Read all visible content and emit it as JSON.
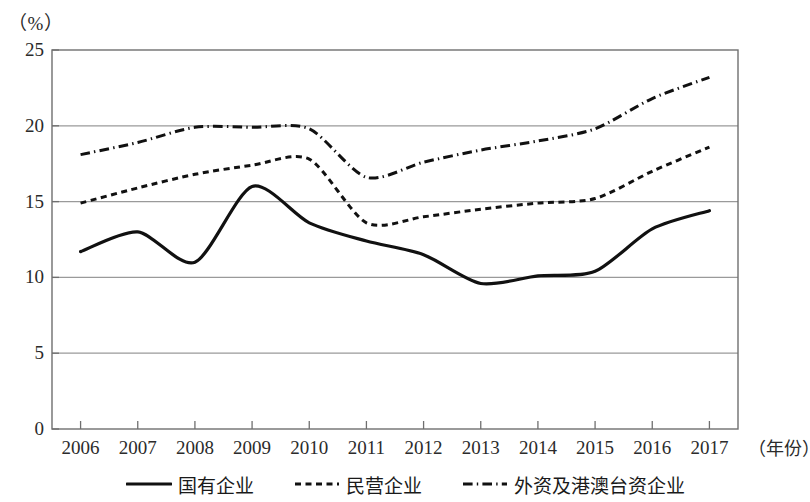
{
  "chart_data": {
    "type": "line",
    "title": "",
    "xlabel": "（年份）",
    "ylabel": "（%）",
    "ylim": [
      0,
      25
    ],
    "yticks": [
      0,
      5,
      10,
      15,
      20,
      25
    ],
    "grid": true,
    "grid_axis": "y",
    "legend_position": "bottom",
    "categories": [
      "2006",
      "2007",
      "2008",
      "2009",
      "2010",
      "2011",
      "2012",
      "2013",
      "2014",
      "2015",
      "2016",
      "2017"
    ],
    "x": [
      2006,
      2007,
      2008,
      2009,
      2010,
      2011,
      2012,
      2013,
      2014,
      2015,
      2016,
      2017
    ],
    "series": [
      {
        "name": "国有企业",
        "style": "solid",
        "color": "#111111",
        "width": 3.2,
        "values": [
          11.7,
          13.0,
          11.0,
          16.0,
          13.6,
          12.4,
          11.5,
          9.6,
          10.1,
          10.4,
          13.2,
          14.4
        ]
      },
      {
        "name": "民营企业",
        "style": "dotted",
        "color": "#111111",
        "width": 3.0,
        "values": [
          14.9,
          15.9,
          16.8,
          17.4,
          17.8,
          13.6,
          14.0,
          14.5,
          14.9,
          15.2,
          17.0,
          18.6
        ]
      },
      {
        "name": "外资及港澳台资企业",
        "style": "dash-dot",
        "color": "#111111",
        "width": 3.0,
        "values": [
          18.1,
          18.9,
          19.9,
          19.9,
          19.8,
          16.6,
          17.6,
          18.4,
          19.0,
          19.8,
          21.8,
          23.2
        ]
      }
    ]
  },
  "axis": {
    "y_unit": "（%）",
    "x_unit": "（年份）",
    "y_tick_labels": [
      "0",
      "5",
      "10",
      "15",
      "20",
      "25"
    ],
    "x_tick_labels": [
      "2006",
      "2007",
      "2008",
      "2009",
      "2010",
      "2011",
      "2012",
      "2013",
      "2014",
      "2015",
      "2016",
      "2017"
    ]
  },
  "legend": {
    "items": [
      {
        "label": "国有企业",
        "style": "solid"
      },
      {
        "label": "民营企业",
        "style": "dotted"
      },
      {
        "label": "外资及港澳台资企业",
        "style": "dash-dot"
      }
    ]
  },
  "colors": {
    "line": "#111111",
    "grid": "#9a9a9a",
    "frame": "#6f6f6f",
    "text": "#2b2b2b",
    "background": "#ffffff"
  }
}
